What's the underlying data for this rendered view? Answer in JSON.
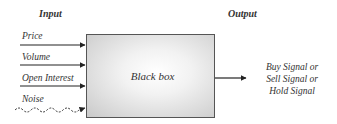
{
  "diagram": {
    "input_heading": "Input",
    "output_heading": "Output",
    "inputs": [
      {
        "label": "Price",
        "line_style": "solid"
      },
      {
        "label": "Volume",
        "line_style": "solid"
      },
      {
        "label": "Open Interest",
        "line_style": "solid"
      },
      {
        "label": "Noise",
        "line_style": "wavy-dashed"
      }
    ],
    "box_label": "Black box",
    "outputs": [
      "Buy Signal or",
      "Sell Signal or",
      "Hold Signal"
    ]
  }
}
